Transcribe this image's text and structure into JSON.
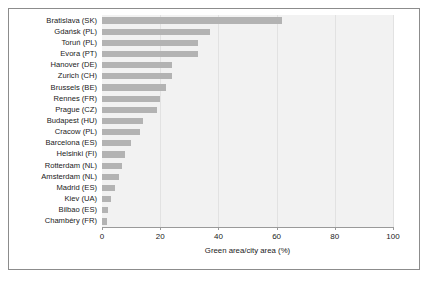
{
  "chart_data": {
    "type": "bar",
    "orientation": "horizontal",
    "title": "",
    "xlabel": "Green area/city area (%)",
    "ylabel": "",
    "xlim": [
      0,
      100
    ],
    "xticks": [
      0,
      20,
      40,
      60,
      80,
      100
    ],
    "xticklabels": [
      "0",
      "20",
      "40",
      "60",
      "80",
      "100"
    ],
    "grid": true,
    "legend": null,
    "categories": [
      "Bratislava (SK)",
      "Gdańsk (PL)",
      "Toruń (PL)",
      "Evora (PT)",
      "Hanover (DE)",
      "Zurich (CH)",
      "Brussels (BE)",
      "Rennes (FR)",
      "Prague (CZ)",
      "Budapest (HU)",
      "Cracow (PL)",
      "Barcelona (ES)",
      "Helsinki (FI)",
      "Rotterdam (NL)",
      "Amsterdam (NL)",
      "Madrid (ES)",
      "Kiev (UA)",
      "Bilbao (ES)",
      "Chambéry (FR)"
    ],
    "values": [
      62,
      37,
      33,
      33,
      24,
      24,
      22,
      20,
      19,
      14,
      13,
      10,
      8,
      7,
      6,
      4.5,
      3,
      2,
      1.8
    ],
    "bar_color": "#b3b3b3",
    "plot_background": "#f2f2f2"
  }
}
